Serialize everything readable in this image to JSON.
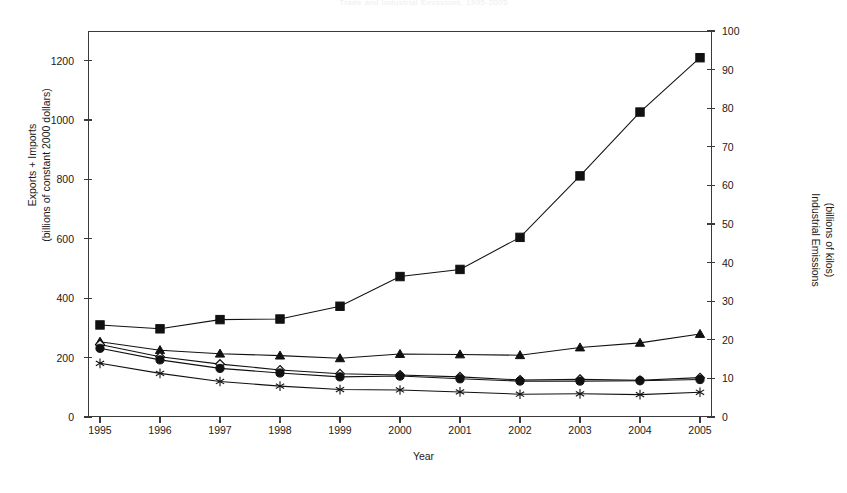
{
  "title": "Trade and Industrial Emissions, 1995-2005",
  "axes": {
    "x_title": "Year",
    "y_left_line1": "Exports + Imports",
    "y_left_line2": "(billions of constant 2000 dollars)",
    "y_right_line1": "Industrial Emissions",
    "y_right_line2": "(billions of kilos)"
  },
  "chart_data": {
    "type": "line",
    "title": "Trade and Industrial Emissions, 1995-2005",
    "xlabel": "Year",
    "ylabel": "Exports + Imports (billions of constant 2000 dollars)",
    "y2label": "Industrial Emissions (billions of kilos)",
    "grid": false,
    "legend": "none",
    "x": [
      1995,
      1996,
      1997,
      1998,
      1999,
      2000,
      2001,
      2002,
      2003,
      2004,
      2005
    ],
    "xlim": [
      1994.8,
      2005.2
    ],
    "xticklabels": [
      "1995",
      "1996",
      "1997",
      "1998",
      "1999",
      "2000",
      "2001",
      "2002",
      "2003",
      "2004",
      "2005"
    ],
    "ylim": [
      0,
      1300
    ],
    "yticks": [
      0,
      200,
      400,
      600,
      800,
      1000,
      1200
    ],
    "y2lim": [
      0,
      100
    ],
    "y2ticks": [
      0,
      10,
      20,
      30,
      40,
      50,
      60,
      70,
      80,
      90,
      100
    ],
    "series": [
      {
        "name": "Exports + Imports",
        "marker": "filled-square",
        "axis": "left",
        "values": [
          310,
          297,
          328,
          330,
          373,
          473,
          497,
          605,
          812,
          1027,
          1210
        ]
      },
      {
        "name": "Industrial Emissions - series A",
        "marker": "filled-triangle",
        "axis": "right",
        "values": [
          19.5,
          17.3,
          16.4,
          15.9,
          15.2,
          16.3,
          16.2,
          16.0,
          18.0,
          19.2,
          21.5
        ]
      },
      {
        "name": "Industrial Emissions - series B",
        "marker": "open-diamond",
        "axis": "right",
        "values": [
          18.8,
          15.6,
          13.7,
          12.2,
          11.2,
          10.9,
          10.4,
          9.6,
          9.8,
          9.5,
          10.2
        ]
      },
      {
        "name": "Industrial Emissions - series C",
        "marker": "filled-circle",
        "axis": "right",
        "values": [
          17.8,
          14.8,
          12.6,
          11.4,
          10.4,
          10.6,
          9.9,
          9.3,
          9.3,
          9.4,
          9.7
        ]
      },
      {
        "name": "Industrial Emissions - series D",
        "marker": "asterisk",
        "axis": "right",
        "values": [
          13.9,
          11.3,
          9.2,
          8.0,
          7.1,
          7.0,
          6.5,
          5.9,
          6.0,
          5.8,
          6.4
        ]
      }
    ]
  }
}
